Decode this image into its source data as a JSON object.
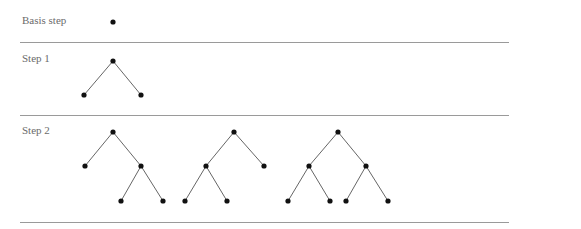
{
  "rows": [
    {
      "label": "Basis step",
      "trees": [
        {
          "nodes": [
            [
              113,
              22
            ]
          ],
          "edges": []
        }
      ]
    },
    {
      "label": "Step 1",
      "trees": [
        {
          "nodes": [
            [
              113,
              61
            ],
            [
              84,
              95
            ],
            [
              141,
              95
            ]
          ],
          "edges": [
            [
              0,
              1
            ],
            [
              0,
              2
            ]
          ]
        }
      ]
    },
    {
      "label": "Step 2",
      "trees": [
        {
          "nodes": [
            [
              113,
              132
            ],
            [
              85,
              166
            ],
            [
              141,
              166
            ],
            [
              121,
              201
            ],
            [
              163,
              201
            ]
          ],
          "edges": [
            [
              0,
              1
            ],
            [
              0,
              2
            ],
            [
              2,
              3
            ],
            [
              2,
              4
            ]
          ]
        },
        {
          "nodes": [
            [
              234,
              132
            ],
            [
              206,
              166
            ],
            [
              264,
              166
            ],
            [
              185,
              201
            ],
            [
              227,
              201
            ]
          ],
          "edges": [
            [
              0,
              1
            ],
            [
              0,
              2
            ],
            [
              1,
              3
            ],
            [
              1,
              4
            ]
          ]
        },
        {
          "nodes": [
            [
              338,
              132
            ],
            [
              309,
              166
            ],
            [
              366,
              166
            ],
            [
              288,
              201
            ],
            [
              330,
              201
            ],
            [
              346,
              201
            ],
            [
              388,
              201
            ]
          ],
          "edges": [
            [
              0,
              1
            ],
            [
              0,
              2
            ],
            [
              1,
              3
            ],
            [
              1,
              4
            ],
            [
              2,
              5
            ],
            [
              2,
              6
            ]
          ]
        }
      ]
    }
  ],
  "label_positions": [
    [
      22,
      14
    ],
    [
      22,
      52
    ],
    [
      22,
      124
    ]
  ],
  "divider_y": [
    42,
    115,
    222
  ],
  "colors": {
    "node": "#111111",
    "edge": "#666666",
    "divider": "#9a9a9a",
    "label": "#6b6b6b"
  }
}
